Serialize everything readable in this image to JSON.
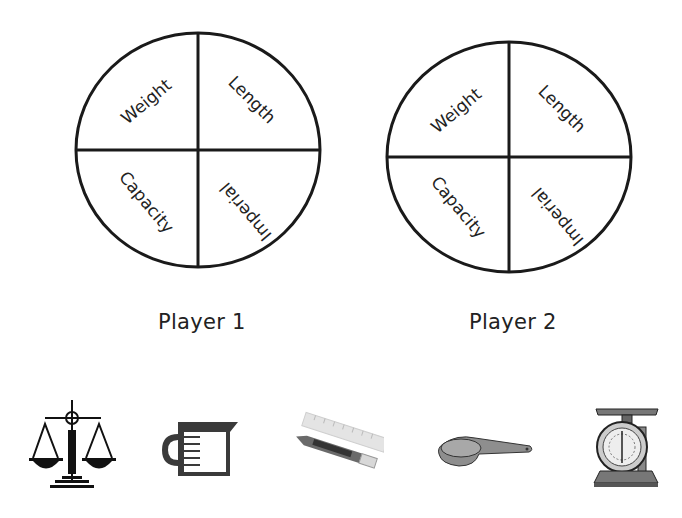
{
  "spinners": [
    {
      "player_label": "Player 1",
      "sections": [
        "Weight",
        "Length",
        "Capacity",
        "Imperial"
      ]
    },
    {
      "player_label": "Player 2",
      "sections": [
        "Weight",
        "Length",
        "Capacity",
        "Imperial"
      ]
    }
  ],
  "icons": [
    {
      "name": "balance-scale-icon"
    },
    {
      "name": "measuring-jug-icon"
    },
    {
      "name": "ruler-and-pencil-icon"
    },
    {
      "name": "measuring-scoop-icon"
    },
    {
      "name": "kitchen-scale-icon"
    }
  ]
}
